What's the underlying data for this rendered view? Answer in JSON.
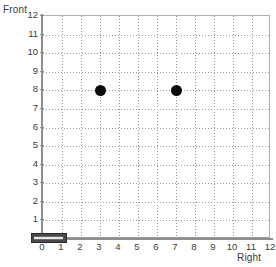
{
  "axes": {
    "y_title": "Front",
    "x_title": "Right",
    "y_ticks": [
      "12",
      "11",
      "10",
      "9",
      "8",
      "7",
      "6",
      "5",
      "4",
      "3",
      "2",
      "1"
    ],
    "x_ticks": [
      "0",
      "1",
      "2",
      "3",
      "4",
      "5",
      "6",
      "7",
      "8",
      "9",
      "10",
      "11",
      "12"
    ]
  },
  "colors": {
    "point": "#0b0b0b",
    "grid": "#9b9b9b",
    "axis": "#8e8e8e",
    "text": "#3a3a3a",
    "robot_body": "#4a4a4a",
    "robot_inner": "#e9e9e9",
    "background": "#ffffff"
  },
  "chart_data": {
    "type": "scatter",
    "title": "",
    "xlabel": "Right",
    "ylabel": "Front",
    "xlim": [
      0,
      12
    ],
    "ylim": [
      0,
      12
    ],
    "xticks": [
      0,
      1,
      2,
      3,
      4,
      5,
      6,
      7,
      8,
      9,
      10,
      11,
      12
    ],
    "yticks": [
      0,
      1,
      2,
      3,
      4,
      5,
      6,
      7,
      8,
      9,
      10,
      11,
      12
    ],
    "grid": true,
    "grid_style": "dotted",
    "legend": "none",
    "series": [
      {
        "name": "detected-objects",
        "marker": "filled-circle",
        "color": "#0b0b0b",
        "points": [
          {
            "x": 3,
            "y": 8
          },
          {
            "x": 7,
            "y": 8
          }
        ]
      },
      {
        "name": "robot",
        "marker": "rectangle",
        "color": "#4a4a4a",
        "points": [
          {
            "x": 0.35,
            "y": 0,
            "width": 1.9,
            "height": 0.55,
            "heading": 90
          }
        ]
      }
    ]
  }
}
